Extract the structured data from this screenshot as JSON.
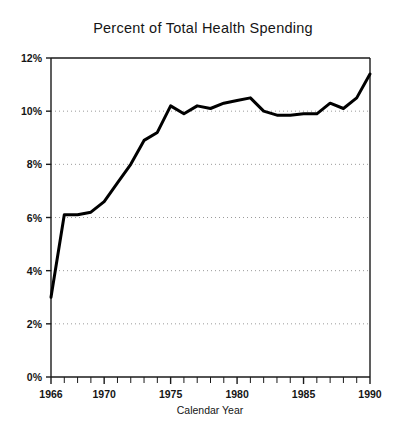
{
  "chart_data": {
    "type": "line",
    "title": "Percent of Total Health Spending",
    "xlabel": "Calendar Year",
    "ylabel": "",
    "xlim": [
      1966,
      1990
    ],
    "ylim": [
      0,
      12
    ],
    "grid": true,
    "grid_axis": "y",
    "legend": null,
    "x_tick_labels": [
      "1966",
      "1970",
      "1975",
      "1980",
      "1985",
      "1990"
    ],
    "x_tick_values": [
      1966,
      1970,
      1975,
      1980,
      1985,
      1990
    ],
    "x_minor_tick_step": 1,
    "y_tick_labels": [
      "0%",
      "2%",
      "4%",
      "6%",
      "8%",
      "10%",
      "12%"
    ],
    "y_tick_values": [
      0,
      2,
      4,
      6,
      8,
      10,
      12
    ],
    "series": [
      {
        "name": "Percent of Total Health Spending",
        "color": "#000000",
        "line_width": 3,
        "x": [
          1966,
          1967,
          1968,
          1969,
          1970,
          1971,
          1972,
          1973,
          1974,
          1975,
          1976,
          1977,
          1978,
          1979,
          1980,
          1981,
          1982,
          1983,
          1984,
          1985,
          1986,
          1987,
          1988,
          1989,
          1990
        ],
        "values": [
          3.0,
          6.1,
          6.1,
          6.2,
          6.6,
          7.3,
          8.0,
          8.9,
          9.2,
          10.2,
          9.9,
          10.2,
          10.1,
          10.3,
          10.4,
          10.5,
          10.0,
          9.85,
          9.85,
          9.9,
          9.9,
          10.3,
          10.1,
          10.5,
          11.4
        ]
      }
    ]
  },
  "figure": {
    "background_color": "#ffffff",
    "axis_color": "#1a1a1a",
    "grid_color": "#9a9a9a"
  }
}
